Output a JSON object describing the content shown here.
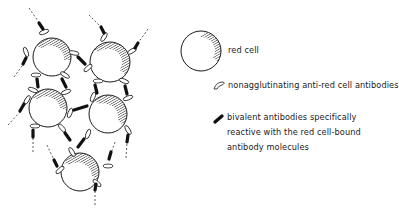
{
  "figure": {
    "type": "schematic diagram",
    "cluster": {
      "cell_count": 5,
      "cells": [
        {
          "id": "cell-1",
          "cx": 52,
          "cy": 57,
          "r": 19
        },
        {
          "id": "cell-2",
          "cx": 110,
          "cy": 62,
          "r": 20
        },
        {
          "id": "cell-3",
          "cx": 48,
          "cy": 108,
          "r": 19
        },
        {
          "id": "cell-4",
          "cx": 108,
          "cy": 114,
          "r": 19
        },
        {
          "id": "cell-5",
          "cx": 80,
          "cy": 172,
          "r": 19
        }
      ]
    }
  },
  "legend": {
    "items": [
      {
        "icon": "red-cell-icon",
        "label": "red cell"
      },
      {
        "icon": "nonagglutinating-antibody-icon",
        "label": "nonagglutinating anti-red cell antibodies"
      },
      {
        "icon": "bivalent-antibody-icon",
        "lines": [
          "bivalent antibodies specifically",
          "reactive with the red cell-bound",
          "antibody molecules"
        ]
      }
    ]
  },
  "colors": {
    "line": "#1a1a1a",
    "background": "#ffffff",
    "antibody_fill": "#111111"
  }
}
